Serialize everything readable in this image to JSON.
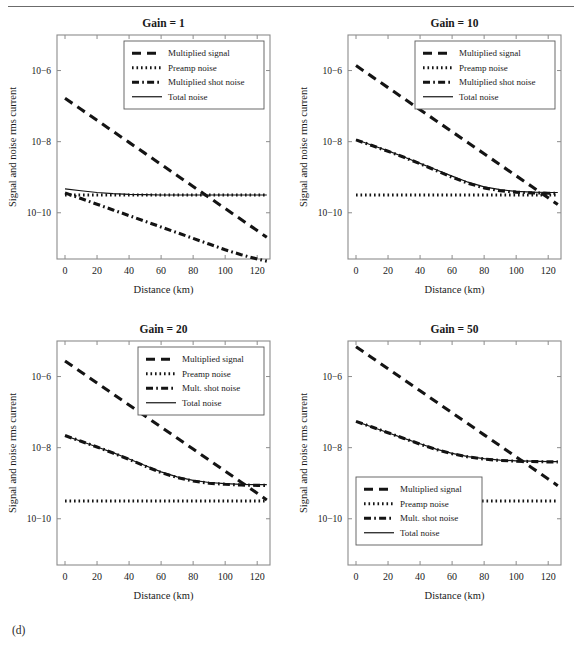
{
  "figure": {
    "caption": "(d)",
    "rule_color": "#6b6b6b"
  },
  "axes": {
    "xlabel": "Distance (km)",
    "ylabel": "Signal and noise rms current",
    "xticks": [
      "0",
      "20",
      "40",
      "60",
      "80",
      "100",
      "120"
    ],
    "xtick_values": [
      0,
      20,
      40,
      60,
      80,
      100,
      120
    ],
    "yticks": [
      "10−6",
      "10−8",
      "10−10"
    ],
    "ytick_values": [
      -6,
      -8,
      -10
    ],
    "xlim": [
      -5,
      128
    ],
    "ylim": [
      -11.3,
      -5.0
    ],
    "grid": false,
    "yscale": "log",
    "line_color": "#141414"
  },
  "legend_style": {
    "signal": "dashed",
    "preamp": "dotted",
    "shot": "dash-dot",
    "total": "solid"
  },
  "chart_data": [
    {
      "type": "line",
      "title": "Gain = 1",
      "xlabel": "Distance (km)",
      "ylabel": "Signal and noise rms current",
      "xlim": [
        -5,
        128
      ],
      "ylim": [
        -11.3,
        -5.0
      ],
      "grid": false,
      "legend_position": "upper-right",
      "legend": [
        "Multiplied signal",
        "Preamp noise",
        "Multiplied shot noise",
        "Total noise"
      ],
      "x": [
        0,
        10,
        20,
        30,
        40,
        50,
        60,
        70,
        80,
        90,
        100,
        110,
        120,
        126
      ],
      "series": [
        {
          "name": "Multiplied signal",
          "style": "dashed",
          "log10_values": [
            -6.78,
            -7.09,
            -7.4,
            -7.71,
            -8.02,
            -8.33,
            -8.64,
            -8.95,
            -9.26,
            -9.57,
            -9.88,
            -10.19,
            -10.5,
            -10.69
          ]
        },
        {
          "name": "Preamp noise",
          "style": "dotted",
          "log10_values": [
            -9.5,
            -9.5,
            -9.5,
            -9.5,
            -9.5,
            -9.5,
            -9.5,
            -9.5,
            -9.5,
            -9.5,
            -9.5,
            -9.5,
            -9.5,
            -9.5
          ]
        },
        {
          "name": "Multiplied shot noise",
          "style": "dash-dot",
          "log10_values": [
            -9.44,
            -9.6,
            -9.76,
            -9.92,
            -10.08,
            -10.24,
            -10.4,
            -10.56,
            -10.72,
            -10.88,
            -11.04,
            -11.18,
            -11.3,
            -11.36
          ]
        },
        {
          "name": "Total noise",
          "style": "solid",
          "log10_values": [
            -9.33,
            -9.38,
            -9.43,
            -9.46,
            -9.48,
            -9.49,
            -9.5,
            -9.5,
            -9.5,
            -9.5,
            -9.5,
            -9.5,
            -9.5,
            -9.5
          ]
        }
      ]
    },
    {
      "type": "line",
      "title": "Gain = 10",
      "xlabel": "Distance (km)",
      "ylabel": "Signal and noise rms current",
      "xlim": [
        -5,
        128
      ],
      "ylim": [
        -11.3,
        -5.0
      ],
      "grid": false,
      "legend_position": "upper-right",
      "legend": [
        "Multiplied signal",
        "Preamp noise",
        "Multiplied shot noise",
        "Total noise"
      ],
      "x": [
        0,
        10,
        20,
        30,
        40,
        50,
        60,
        70,
        80,
        90,
        100,
        110,
        120,
        126
      ],
      "series": [
        {
          "name": "Multiplied signal",
          "style": "dashed",
          "log10_values": [
            -5.86,
            -6.17,
            -6.48,
            -6.79,
            -7.1,
            -7.41,
            -7.72,
            -8.03,
            -8.34,
            -8.65,
            -8.96,
            -9.27,
            -9.58,
            -9.77
          ]
        },
        {
          "name": "Preamp noise",
          "style": "dotted",
          "log10_values": [
            -9.5,
            -9.5,
            -9.5,
            -9.5,
            -9.5,
            -9.5,
            -9.5,
            -9.5,
            -9.5,
            -9.5,
            -9.5,
            -9.5,
            -9.5,
            -9.5
          ]
        },
        {
          "name": "Multiplied shot noise",
          "style": "dash-dot",
          "log10_values": [
            -7.95,
            -8.11,
            -8.27,
            -8.44,
            -8.62,
            -8.81,
            -9.0,
            -9.17,
            -9.3,
            -9.38,
            -9.42,
            -9.44,
            -9.45,
            -9.45
          ]
        },
        {
          "name": "Total noise",
          "style": "solid",
          "log10_values": [
            -7.94,
            -8.1,
            -8.26,
            -8.43,
            -8.61,
            -8.79,
            -8.97,
            -9.14,
            -9.27,
            -9.35,
            -9.4,
            -9.42,
            -9.43,
            -9.43
          ]
        }
      ]
    },
    {
      "type": "line",
      "title": "Gain = 20",
      "xlabel": "Distance (km)",
      "ylabel": "Signal and noise rms current",
      "xlim": [
        -5,
        128
      ],
      "ylim": [
        -11.3,
        -5.0
      ],
      "grid": false,
      "legend_position": "upper-right",
      "legend": [
        "Multiplied signal",
        "Preamp noise",
        "Mult. shot noise",
        "Total noise"
      ],
      "x": [
        0,
        10,
        20,
        30,
        40,
        50,
        60,
        70,
        80,
        90,
        100,
        110,
        120,
        126
      ],
      "series": [
        {
          "name": "Multiplied signal",
          "style": "dashed",
          "log10_values": [
            -5.56,
            -5.87,
            -6.18,
            -6.49,
            -6.8,
            -7.11,
            -7.42,
            -7.73,
            -8.04,
            -8.35,
            -8.66,
            -8.97,
            -9.28,
            -9.47
          ]
        },
        {
          "name": "Preamp noise",
          "style": "dotted",
          "log10_values": [
            -9.5,
            -9.5,
            -9.5,
            -9.5,
            -9.5,
            -9.5,
            -9.5,
            -9.5,
            -9.5,
            -9.5,
            -9.5,
            -9.5,
            -9.5,
            -9.5
          ]
        },
        {
          "name": "Mult. shot noise",
          "style": "dash-dot",
          "log10_values": [
            -7.66,
            -7.82,
            -7.98,
            -8.15,
            -8.33,
            -8.52,
            -8.7,
            -8.84,
            -8.94,
            -9.0,
            -9.03,
            -9.05,
            -9.06,
            -9.06
          ]
        },
        {
          "name": "Total noise",
          "style": "solid",
          "log10_values": [
            -7.66,
            -7.82,
            -7.98,
            -8.14,
            -8.32,
            -8.5,
            -8.68,
            -8.82,
            -8.92,
            -8.98,
            -9.01,
            -9.03,
            -9.04,
            -9.04
          ]
        }
      ]
    },
    {
      "type": "line",
      "title": "Gain = 50",
      "xlabel": "Distance (km)",
      "ylabel": "Signal and noise rms current",
      "xlim": [
        -5,
        128
      ],
      "ylim": [
        -11.3,
        -5.0
      ],
      "grid": false,
      "legend_position": "lower-left",
      "legend": [
        "Multiplied signal",
        "Preamp noise",
        "Mult. shot noise",
        "Total noise"
      ],
      "x": [
        0,
        10,
        20,
        30,
        40,
        50,
        60,
        70,
        80,
        90,
        100,
        110,
        120,
        126
      ],
      "series": [
        {
          "name": "Multiplied signal",
          "style": "dashed",
          "log10_values": [
            -5.16,
            -5.47,
            -5.78,
            -6.09,
            -6.4,
            -6.71,
            -7.02,
            -7.33,
            -7.64,
            -7.95,
            -8.26,
            -8.57,
            -8.88,
            -9.07
          ]
        },
        {
          "name": "Preamp noise",
          "style": "dotted",
          "log10_values": [
            -9.5,
            -9.5,
            -9.5,
            -9.5,
            -9.5,
            -9.5,
            -9.5,
            -9.5,
            -9.5,
            -9.5,
            -9.5,
            -9.5,
            -9.5,
            -9.5
          ]
        },
        {
          "name": "Mult. shot noise",
          "style": "dash-dot",
          "log10_values": [
            -7.26,
            -7.42,
            -7.58,
            -7.74,
            -7.9,
            -8.05,
            -8.17,
            -8.26,
            -8.32,
            -8.36,
            -8.38,
            -8.39,
            -8.4,
            -8.4
          ]
        },
        {
          "name": "Total noise",
          "style": "solid",
          "log10_values": [
            -7.26,
            -7.42,
            -7.58,
            -7.74,
            -7.89,
            -8.04,
            -8.16,
            -8.25,
            -8.31,
            -8.35,
            -8.37,
            -8.38,
            -8.39,
            -8.39
          ]
        }
      ]
    }
  ]
}
